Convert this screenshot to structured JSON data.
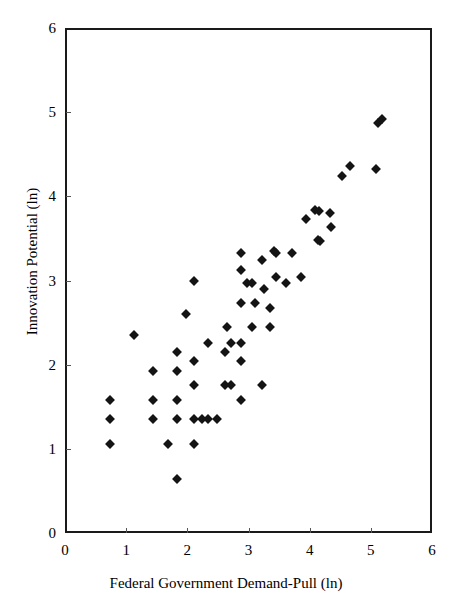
{
  "chart_data": {
    "type": "scatter",
    "title": "",
    "xlabel": "Federal Government Demand-Pull (ln)",
    "ylabel": "Innovation Potential (ln)",
    "xlim": [
      0,
      6
    ],
    "ylim": [
      0,
      6
    ],
    "xticks": [
      "0",
      "1",
      "2",
      "3",
      "4",
      "5",
      "6"
    ],
    "yticks": [
      "0",
      "1",
      "2",
      "3",
      "4",
      "5",
      "6"
    ],
    "xtick_values": [
      0,
      1,
      2,
      3,
      4,
      5,
      6
    ],
    "ytick_values": [
      0,
      1,
      2,
      3,
      4,
      5,
      6
    ],
    "grid": false,
    "legend": null,
    "marker": {
      "shape": "diamond",
      "color": "#141414",
      "size_px": 7
    },
    "series": [
      {
        "name": "Observations",
        "points": [
          [
            0.7,
            1.6
          ],
          [
            0.7,
            1.38
          ],
          [
            0.7,
            1.08
          ],
          [
            1.1,
            2.38
          ],
          [
            1.4,
            1.95
          ],
          [
            1.4,
            1.6
          ],
          [
            1.4,
            1.38
          ],
          [
            1.65,
            1.08
          ],
          [
            1.8,
            2.18
          ],
          [
            1.8,
            1.95
          ],
          [
            1.8,
            1.6
          ],
          [
            1.8,
            1.38
          ],
          [
            1.8,
            0.67
          ],
          [
            1.95,
            2.63
          ],
          [
            2.08,
            3.02
          ],
          [
            2.08,
            2.07
          ],
          [
            2.08,
            1.78
          ],
          [
            2.08,
            1.38
          ],
          [
            2.08,
            1.08
          ],
          [
            2.2,
            1.38
          ],
          [
            2.3,
            2.28
          ],
          [
            2.3,
            1.38
          ],
          [
            2.45,
            1.38
          ],
          [
            2.58,
            2.18
          ],
          [
            2.58,
            1.78
          ],
          [
            2.62,
            2.47
          ],
          [
            2.68,
            2.28
          ],
          [
            2.68,
            1.78
          ],
          [
            2.85,
            3.35
          ],
          [
            2.85,
            3.15
          ],
          [
            2.85,
            2.76
          ],
          [
            2.85,
            2.28
          ],
          [
            2.85,
            2.07
          ],
          [
            2.85,
            1.6
          ],
          [
            2.95,
            3.0
          ],
          [
            3.02,
            3.0
          ],
          [
            3.02,
            2.47
          ],
          [
            3.08,
            2.76
          ],
          [
            3.18,
            3.27
          ],
          [
            3.18,
            1.78
          ],
          [
            3.22,
            2.92
          ],
          [
            3.32,
            2.7
          ],
          [
            3.32,
            2.47
          ],
          [
            3.38,
            3.37
          ],
          [
            3.42,
            3.35
          ],
          [
            3.42,
            3.07
          ],
          [
            3.58,
            2.99
          ],
          [
            3.68,
            3.35
          ],
          [
            3.82,
            3.07
          ],
          [
            3.9,
            3.76
          ],
          [
            4.06,
            3.86
          ],
          [
            4.12,
            3.85
          ],
          [
            4.1,
            3.5
          ],
          [
            4.14,
            3.49
          ],
          [
            4.3,
            3.82
          ],
          [
            4.32,
            3.66
          ],
          [
            4.5,
            4.27
          ],
          [
            4.62,
            4.39
          ],
          [
            5.05,
            4.35
          ],
          [
            5.08,
            4.9
          ],
          [
            5.15,
            4.94
          ]
        ]
      }
    ]
  }
}
